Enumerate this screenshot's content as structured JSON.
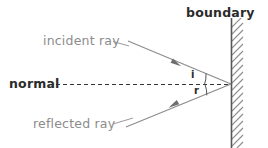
{
  "diagram": {
    "type": "ray-diagram",
    "background_color": "#ffffff",
    "labels": {
      "boundary": "boundary",
      "incident_ray": "incident ray",
      "normal": "normal",
      "reflected_ray": "reflected ray",
      "angle_of_incidence": "i",
      "angle_of_reflection": "r"
    },
    "colors": {
      "ray_line": "#8c8c8c",
      "label_gray": "#8c8c8c",
      "label_dark": "#2b2b2b",
      "boundary_line": "#555555",
      "hatch": "#8c8c8c",
      "normal_dash": "#333333"
    },
    "geometry": {
      "incidence_point": {
        "x": 231,
        "y": 84
      },
      "boundary_x": 231,
      "boundary_top_y": 18,
      "boundary_bottom_y": 148,
      "normal_y": 84,
      "normal_start_x": 56,
      "normal_end_x": 231,
      "incident_start": {
        "x": 128,
        "y": 41
      },
      "reflected_end": {
        "x": 126,
        "y": 127
      },
      "incident_arrow": {
        "x": 176,
        "y": 63
      },
      "reflected_arrow": {
        "x": 174,
        "y": 105
      },
      "hatch_spacing": 7,
      "hatch_length": 11,
      "hatch_angle_deg": 45
    }
  }
}
